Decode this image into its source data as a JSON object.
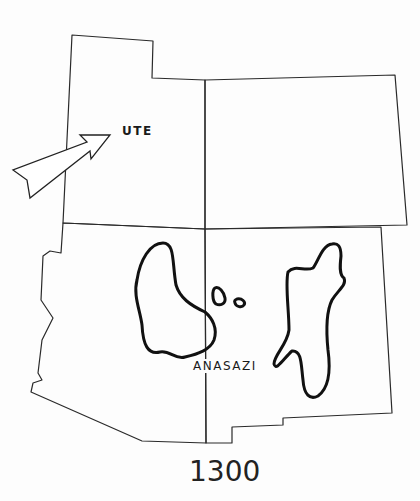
{
  "map": {
    "title_year": "1300",
    "labels": {
      "ute": "UTE",
      "anasazi": "ANASAZI"
    },
    "colors": {
      "background": "#fdfdfd",
      "borders": "#2a2a2a",
      "regions": "#111111"
    },
    "features": [
      {
        "type": "state-border",
        "name": "utah"
      },
      {
        "type": "state-border",
        "name": "colorado"
      },
      {
        "type": "state-border",
        "name": "arizona"
      },
      {
        "type": "state-border",
        "name": "new-mexico"
      },
      {
        "type": "culture-region",
        "name": "anasazi",
        "parts": 4
      },
      {
        "type": "migration-arrow",
        "name": "ute",
        "direction": "northeast"
      }
    ]
  }
}
